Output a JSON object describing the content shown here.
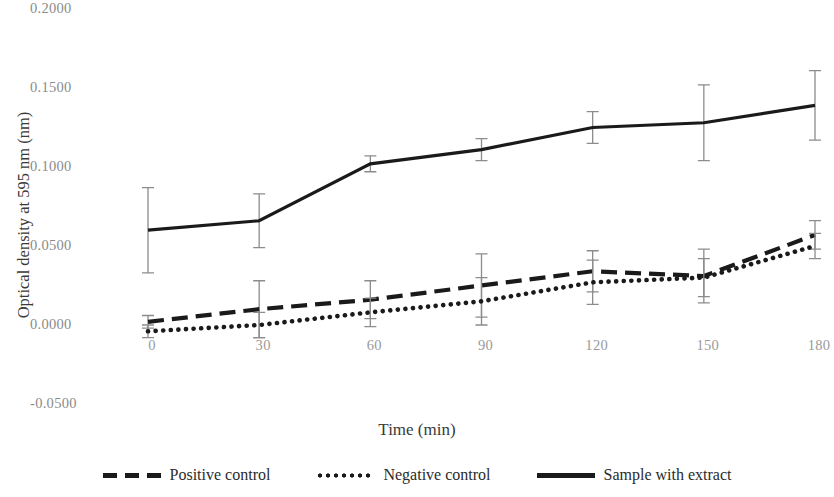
{
  "chart_data": {
    "type": "line",
    "title": "",
    "xlabel": "Time (min)",
    "ylabel": "Optical density at 595 nm (nm)",
    "x": [
      0,
      30,
      60,
      90,
      120,
      150,
      180
    ],
    "xticklabels": [
      "0",
      "30",
      "60",
      "90",
      "120",
      "150",
      "180"
    ],
    "yticks": [
      0.2,
      0.15,
      0.1,
      0.05,
      0.0,
      -0.05
    ],
    "yticklabels": [
      "0.2000",
      "0.1500",
      "0.1000",
      "0.0500",
      "0.0000",
      "-0.0500"
    ],
    "ylim": [
      -0.05,
      0.2
    ],
    "xlim": [
      0,
      180
    ],
    "grid": false,
    "legend_position": "bottom",
    "series": [
      {
        "name": "Positive control",
        "style": "dashed",
        "color": "#1a1a1a",
        "values": [
          0.002,
          0.01,
          0.016,
          0.025,
          0.034,
          0.031,
          0.057
        ],
        "errors": [
          0.004,
          0.018,
          0.012,
          0.02,
          0.013,
          0.017,
          0.009
        ]
      },
      {
        "name": "Negative control",
        "style": "dotted",
        "color": "#1a1a1a",
        "values": [
          -0.004,
          0.0,
          0.008,
          0.015,
          0.027,
          0.03,
          0.05
        ],
        "errors": [
          0.004,
          0.008,
          0.009,
          0.015,
          0.014,
          0.012,
          0.008
        ]
      },
      {
        "name": "Sample with extract",
        "style": "solid",
        "color": "#1a1a1a",
        "values": [
          0.06,
          0.066,
          0.102,
          0.111,
          0.125,
          0.128,
          0.139
        ],
        "errors": [
          0.027,
          0.017,
          0.005,
          0.007,
          0.01,
          0.024,
          0.022
        ]
      }
    ]
  },
  "axis": {
    "y_title": "Optical density at 595 nm (nm)",
    "x_title": "Time (min)",
    "yticklabels": [
      "0.2000",
      "0.1500",
      "0.1000",
      "0.0500",
      "0.0000",
      "-0.0500"
    ],
    "xticklabels": [
      "0",
      "30",
      "60",
      "90",
      "120",
      "150",
      "180"
    ]
  },
  "legend": {
    "items": [
      {
        "label": "Positive control",
        "style": "dashed"
      },
      {
        "label": "Negative control",
        "style": "dotted"
      },
      {
        "label": "Sample with extract",
        "style": "solid"
      }
    ]
  }
}
